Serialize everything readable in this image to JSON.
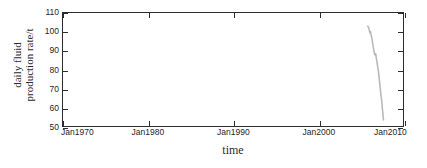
{
  "chart_data": {
    "type": "line",
    "title": "",
    "xlabel": "time",
    "ylabel_line1": "daily fluid",
    "ylabel_line2": "production rate/t",
    "ylabel": "daily fluid production rate/t",
    "grid": false,
    "legend": "none",
    "line_color": "#b9b9b9",
    "axis_color": "#2c2c2c",
    "background": "#ffffff",
    "ylim": [
      50,
      110
    ],
    "yticks": [
      50,
      60,
      70,
      80,
      90,
      100,
      110
    ],
    "ytick_labels": [
      "50",
      "60",
      "70",
      "80",
      "90",
      "100",
      "110"
    ],
    "xlim_years": [
      1970,
      2010
    ],
    "xticks_years": [
      1970,
      1980,
      1990,
      2000,
      2010
    ],
    "xtick_labels": [
      "Jan1970",
      "Jan1980",
      "Jan1990",
      "Jan2000",
      "Jan2010"
    ],
    "series": [
      {
        "name": "daily fluid production rate",
        "x_years": [
          2005.85,
          2005.95,
          2006.02,
          2006.08,
          2006.12,
          2006.18,
          2006.23,
          2006.3,
          2006.36,
          2006.42,
          2006.48,
          2006.54,
          2006.6,
          2006.66,
          2006.72,
          2006.78,
          2006.84,
          2006.9,
          2006.96,
          2007.02,
          2007.08,
          2007.14,
          2007.18,
          2007.22,
          2007.26,
          2007.3,
          2007.34,
          2007.38,
          2007.42,
          2007.46,
          2007.5,
          2007.54,
          2007.58,
          2007.62,
          2007.66,
          2007.7
        ],
        "y_values": [
          103.0,
          102.4,
          101.2,
          100.0,
          99.4,
          100.2,
          98.6,
          97.5,
          96.0,
          94.2,
          92.5,
          90.8,
          89.4,
          88.2,
          87.6,
          88.4,
          86.8,
          85.0,
          83.2,
          81.5,
          79.8,
          78.0,
          76.2,
          74.5,
          72.8,
          71.0,
          69.2,
          67.5,
          66.0,
          64.6,
          63.0,
          61.2,
          59.0,
          57.2,
          55.2,
          53.2
        ]
      }
    ]
  }
}
